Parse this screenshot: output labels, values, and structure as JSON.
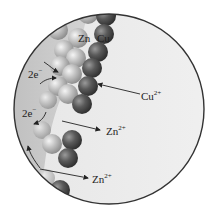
{
  "diagram": {
    "colors": {
      "background": "#ffffff",
      "solution": "#ececec",
      "zinc_region": "#c9c9c9",
      "circle_border": "#333333",
      "zinc_atom": "#bdbdbd",
      "copper_atom": "#555555",
      "text": "#222222"
    },
    "labels": {
      "zn": "Zn",
      "cu": "Cu",
      "electrons_1": "2e",
      "electrons_1_sup": "−",
      "electrons_2": "2e",
      "electrons_2_sup": "−",
      "cu_ion": "Cu",
      "cu_ion_sup": "2+",
      "zn_ion_1": "Zn",
      "zn_ion_1_sup": "2+",
      "zn_ion_2": "Zn",
      "zn_ion_2_sup": "2+"
    }
  }
}
